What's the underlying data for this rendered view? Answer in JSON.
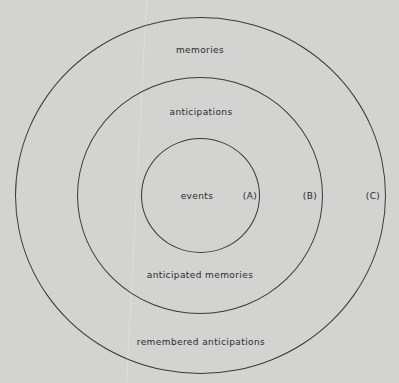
{
  "diagram": {
    "type": "concentric-circles",
    "background_color": "#d3d3d2",
    "line_color": "#3a3a3a",
    "circles": [
      {
        "id": "A",
        "marker": "(A)",
        "inner_label": "events"
      },
      {
        "id": "B",
        "marker": "(B)",
        "top_label": "anticipations",
        "bottom_label": "anticipated memories"
      },
      {
        "id": "C",
        "marker": "(C)",
        "top_label": "memories",
        "bottom_label": "remembered anticipations"
      }
    ]
  }
}
